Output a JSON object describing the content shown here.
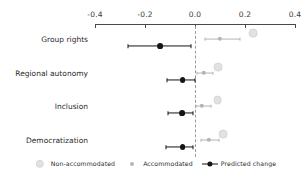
{
  "chart_data": {
    "type": "scatter",
    "title": "",
    "subtitle": "",
    "xlabel": "",
    "ylabel": "",
    "xlim": [
      -0.4,
      0.4
    ],
    "xticks": [
      -0.4,
      -0.2,
      0.0,
      0.2,
      0.4
    ],
    "xticklabels": [
      "-0.4",
      "-0.2",
      "0.0",
      "0.2",
      "0.4"
    ],
    "grid": false,
    "zero_reference_line": 0.0,
    "zero_reference_style": "dashed",
    "axis_position": "top",
    "legend_position": "bottom",
    "categories": [
      "Group rights",
      "Regional autonomy",
      "Inclusion",
      "Democratization"
    ],
    "series": [
      {
        "name": "Non-accommodated",
        "color": "#e2e2e2",
        "marker": "circle",
        "values": [
          0.232,
          0.092,
          0.09,
          0.112
        ],
        "ci_low": [
          0.232,
          0.092,
          0.09,
          0.112
        ],
        "ci_high": [
          0.232,
          0.092,
          0.09,
          0.112
        ]
      },
      {
        "name": "Accommodated",
        "color": "#b4b4b4",
        "marker": "circle",
        "values": [
          0.1,
          0.034,
          0.028,
          0.056
        ],
        "ci_low": [
          0.04,
          0.006,
          0.004,
          0.024
        ],
        "ci_high": [
          0.18,
          0.07,
          0.062,
          0.096
        ]
      },
      {
        "name": "Predicted change",
        "color": "#151515",
        "marker": "circle",
        "values": [
          -0.14,
          -0.05,
          -0.052,
          -0.05
        ],
        "ci_low": [
          -0.268,
          -0.112,
          -0.108,
          -0.118
        ],
        "ci_high": [
          -0.018,
          -0.002,
          -0.01,
          -0.008
        ]
      }
    ]
  },
  "legend": {
    "items": [
      {
        "label": "Non-accommodated",
        "color": "#e2e2e2",
        "style": "dot"
      },
      {
        "label": "Accommodated",
        "color": "#b4b4b4",
        "style": "dot"
      },
      {
        "label": "Predicted change",
        "color": "#151515",
        "style": "dot-line"
      }
    ]
  },
  "axis": {
    "tick_color": "#4a4a4a",
    "label_color": "#3a3a3a"
  }
}
